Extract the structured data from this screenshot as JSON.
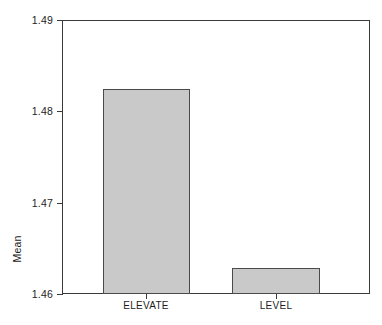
{
  "chart_data": {
    "type": "bar",
    "title": "",
    "subtitle": "",
    "xlabel": "",
    "ylabel": "Mean",
    "categories": [
      "ELEVATE",
      "LEVEL"
    ],
    "values": [
      1.4824,
      1.4629
    ],
    "series": [
      {
        "name": "Mean",
        "values": [
          1.4824,
          1.4629
        ]
      }
    ],
    "ylim": [
      1.46,
      1.49
    ],
    "yticks": [
      1.46,
      1.47,
      1.48,
      1.49
    ],
    "ytick_labels": [
      "1.46",
      "1.47",
      "1.48",
      "1.49"
    ],
    "xtick_labels": [
      "ELEVATE",
      "LEVEL"
    ],
    "grid": false,
    "legend": false,
    "legend_position": "none",
    "bar_fill_color": "#c9c9c9",
    "bar_edge_color": "#4a4a4a",
    "frame_color": "#3a3a3a",
    "background_color": "#ffffff",
    "annotations": []
  },
  "axes": {
    "y": {
      "title": "Mean",
      "ticks": [
        {
          "label": "1.49",
          "value": 1.49
        },
        {
          "label": "1.48",
          "value": 1.48
        },
        {
          "label": "1.47",
          "value": 1.47
        },
        {
          "label": "1.46",
          "value": 1.46
        }
      ]
    },
    "x": {
      "title": "",
      "ticks": [
        {
          "label": "ELEVATE"
        },
        {
          "label": "LEVEL"
        }
      ]
    }
  }
}
